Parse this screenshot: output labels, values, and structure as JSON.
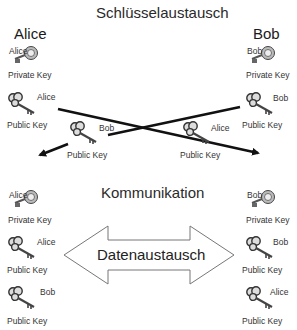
{
  "section_titles": {
    "exchange": "Schlüsselaustausch",
    "communication": "Kommunikation"
  },
  "parties": {
    "left": "Alice",
    "right": "Bob"
  },
  "exchange_keys": {
    "alice_private": {
      "owner": "Alice",
      "caption": "Private Key",
      "icon": "private-key-icon"
    },
    "alice_public": {
      "owner": "Alice",
      "caption": "Public Key",
      "icon": "public-key-icon"
    },
    "bob_private": {
      "owner": "Bob",
      "caption": "Private Key",
      "icon": "private-key-icon"
    },
    "bob_public": {
      "owner": "Bob",
      "caption": "Public Key",
      "icon": "public-key-icon"
    },
    "bob_public_to_alice": {
      "owner": "Bob",
      "caption": "Public Key",
      "icon": "public-key-icon"
    },
    "alice_public_to_bob": {
      "owner": "Alice",
      "caption": "Public Key",
      "icon": "public-key-icon"
    }
  },
  "communication_keys": {
    "left": [
      {
        "owner": "Alice",
        "caption": "Private Key",
        "icon": "private-key-icon"
      },
      {
        "owner": "Alice",
        "caption": "Public Key",
        "icon": "public-key-icon"
      },
      {
        "owner": "Bob",
        "caption": "Public Key",
        "icon": "public-key-icon"
      }
    ],
    "right": [
      {
        "owner": "Bob",
        "caption": "Private Key",
        "icon": "private-key-icon"
      },
      {
        "owner": "Bob",
        "caption": "Public Key",
        "icon": "public-key-icon"
      },
      {
        "owner": "Alice",
        "caption": "Public Key",
        "icon": "public-key-icon"
      }
    ]
  },
  "data_exchange_label": "Datenaustausch",
  "colors": {
    "line": "#111111",
    "key": "#777777",
    "outline": "#666666"
  }
}
